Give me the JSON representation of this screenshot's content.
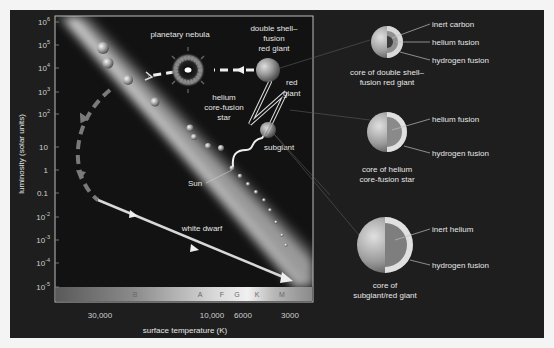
{
  "diagram": {
    "type": "Hertzsprung-Russell diagram with stellar evolution track",
    "y_axis": {
      "title": "luminosity (solar units)",
      "ticks": [
        {
          "base": "10",
          "exp": "6"
        },
        {
          "base": "10",
          "exp": "5"
        },
        {
          "base": "10",
          "exp": "4"
        },
        {
          "base": "10",
          "exp": "3"
        },
        {
          "base": "10",
          "exp": "2"
        },
        {
          "base": "10",
          "exp": ""
        },
        {
          "base": "1",
          "exp": ""
        },
        {
          "base": "0.1",
          "exp": ""
        },
        {
          "base": "10",
          "exp": "-2"
        },
        {
          "base": "10",
          "exp": "-3"
        },
        {
          "base": "10",
          "exp": "-4"
        },
        {
          "base": "10",
          "exp": "-5"
        }
      ]
    },
    "x_axis": {
      "title": "surface temperature (K)",
      "ticks": [
        "30,000",
        "10,000",
        "6000",
        "3000"
      ]
    },
    "spectral_classes": [
      "O",
      "B",
      "A",
      "F",
      "G",
      "K",
      "M"
    ],
    "labels": {
      "planetary_nebula": "planetary nebula",
      "double_shell_1": "double shell–",
      "double_shell_2": "fusion",
      "double_shell_3": "red giant",
      "red_giant_1": "red",
      "red_giant_2": "giant",
      "helium_1": "helium",
      "helium_2": "core-fusion",
      "helium_3": "star",
      "subgiant": "subgiant",
      "sun": "Sun",
      "white_dwarf": "white dwarf"
    },
    "cores": [
      {
        "caption": [
          "core of double shell–",
          "fusion red giant"
        ],
        "layers": [
          "inert carbon",
          "helium fusion",
          "hydrogen fusion"
        ]
      },
      {
        "caption": [
          "core of helium",
          "core-fusion star"
        ],
        "layers": [
          "helium fusion",
          "hydrogen fusion"
        ]
      },
      {
        "caption": [
          "core of",
          "subgiant/red giant"
        ],
        "layers": [
          "inert helium",
          "hydrogen fusion"
        ]
      }
    ],
    "colors": {
      "background": "#1e1e1e",
      "text": "#e6e6e6",
      "frame": "#bdbdbd",
      "main_sequence": "#d8d8d8"
    }
  }
}
